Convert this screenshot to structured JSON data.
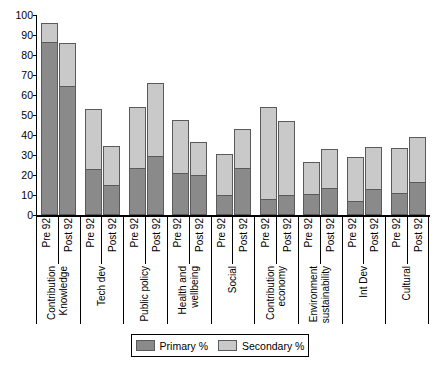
{
  "chart_data": {
    "type": "bar",
    "subtype": "stacked-grouped-column",
    "title": "",
    "xlabel": "",
    "ylabel": "",
    "ylim": [
      0,
      100
    ],
    "yticks": [
      0,
      10,
      20,
      30,
      40,
      50,
      60,
      70,
      80,
      90,
      100
    ],
    "grid": false,
    "legend_position": "bottom-center",
    "categories": [
      "Contribution Knowledge",
      "Tech dev",
      "Public policy",
      "Health and wellbeing",
      "Social",
      "Contribution economy",
      "Environment sustainability",
      "Int Dev",
      "Cultural"
    ],
    "category_lines": [
      [
        "Contribution",
        "Knowledge"
      ],
      [
        "Tech dev"
      ],
      [
        "Public policy"
      ],
      [
        "Health and",
        "wellbeing"
      ],
      [
        "Social"
      ],
      [
        "Contribution",
        "economy"
      ],
      [
        "Environment",
        "sustainability"
      ],
      [
        "Int Dev"
      ],
      [
        "Cultural"
      ]
    ],
    "periods": [
      "Pre 92",
      "Post 92"
    ],
    "series": [
      {
        "name": "Primary %",
        "color": "#8a8a8a",
        "pre92": [
          86,
          22.5,
          23,
          20.5,
          9.5,
          7.5,
          10,
          6.5,
          10.5
        ],
        "post92": [
          64,
          14.5,
          29,
          19.5,
          23,
          9.5,
          13,
          12.5,
          16
        ]
      },
      {
        "name": "Secondary %",
        "color": "#c9c9c9",
        "pre92": [
          10,
          30.5,
          31,
          27,
          21,
          46.5,
          16.5,
          22.5,
          23
        ],
        "post92": [
          22,
          20,
          37,
          17,
          20,
          37.5,
          20,
          21.5,
          23
        ]
      }
    ],
    "totals": {
      "pre92": [
        96,
        53,
        54,
        47.5,
        30.5,
        54,
        26.5,
        29,
        33.5
      ],
      "post92": [
        86,
        34.5,
        66,
        36.5,
        43,
        47,
        33,
        34,
        39
      ]
    }
  },
  "legend": {
    "items": [
      {
        "label": "Primary %",
        "swatch": "primary-swatch"
      },
      {
        "label": "Secondary %",
        "swatch": "secondary-swatch"
      }
    ]
  },
  "axis": {
    "y_labels": [
      "100",
      "90",
      "80",
      "70",
      "60",
      "50",
      "40",
      "30",
      "20",
      "10",
      "0"
    ]
  },
  "colors": {
    "primary": "#8a8a8a",
    "secondary": "#c9c9c9",
    "outline": "#5a5a5a",
    "axis": "#000000",
    "background": "#ffffff"
  }
}
